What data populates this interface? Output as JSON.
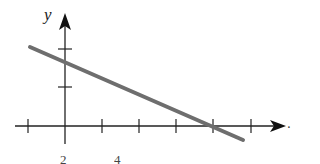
{
  "diagram": {
    "type": "coordinate-plane-line",
    "y_axis_label": "y",
    "x_axis_trailing_mark": ".",
    "x_tick_labels": [
      {
        "text": "2",
        "x": 60
      },
      {
        "text": "4",
        "x": 114
      }
    ],
    "axes_color": "#222222",
    "line_color": "#6e6e6e",
    "line": {
      "from": [
        30,
        47
      ],
      "to": [
        243,
        140
      ]
    },
    "x_ticks": [
      28,
      102,
      139,
      176,
      213,
      251
    ],
    "y_ticks": [
      49,
      87
    ]
  }
}
